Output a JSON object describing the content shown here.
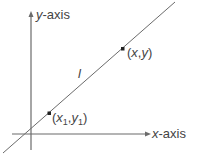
{
  "diagram": {
    "y_axis_label_var": "y",
    "y_axis_label_suffix": "-axis",
    "x_axis_label_var": "x",
    "x_axis_label_suffix": "-axis",
    "line_label": "l",
    "point_general": {
      "open": "(",
      "x": "x",
      "sep": ",",
      "y": "y",
      "close": ")"
    },
    "point_first": {
      "open": "(",
      "x": "x",
      "x_sub": "1",
      "sep": ",",
      "y": "y",
      "y_sub": "1",
      "close": ")"
    },
    "colors": {
      "stroke": "#6b6b6b",
      "text": "#444444",
      "point": "#222222"
    }
  }
}
